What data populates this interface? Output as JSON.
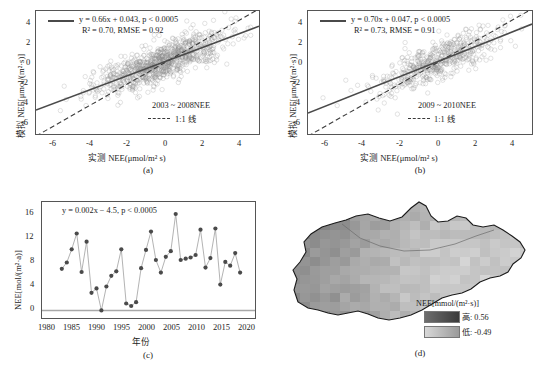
{
  "figure": {
    "panel_letters": {
      "a": "(a)",
      "b": "(b)",
      "c": "(c)",
      "d": "(d)"
    },
    "caption": ""
  },
  "panel_a": {
    "letter": "(a)",
    "equation_line1": "y = 0.66x + 0.043, p < 0.0005",
    "equation_line2": "R² = 0.70, RMSE = 0.92",
    "xlabel": "实测 NEE(μmol/m² s)",
    "ylabel": "模拟 NEE[μmol/(m²·s)]",
    "legend_series": "2003 ~ 2008NEE",
    "legend_oneone": "1:1 线",
    "xticks": [
      "-6",
      "-4",
      "-2",
      "0",
      "2",
      "4"
    ],
    "yticks": [
      "4",
      "2",
      "0",
      "-2",
      "-4",
      "-6"
    ],
    "xlim": [
      -7.2,
      5.0
    ],
    "ylim": [
      -7.0,
      4.8
    ],
    "slope": 0.66,
    "intercept": 0.043,
    "r2": 0.7,
    "rmse": 0.92,
    "p_value": "< 0.0005",
    "n_points": 900
  },
  "panel_b": {
    "letter": "(b)",
    "equation_line1": "y = 0.70x + 0.047, p < 0.0005",
    "equation_line2": "R² = 0.73, RMSE = 0.91",
    "xlabel": "实测 NEE(μmol/m² s)",
    "ylabel": "模拟 NEE[μmol/(m²·s)]",
    "legend_series": "2009 ~ 2010NEE",
    "legend_oneone": "1:1 线",
    "xticks": [
      "-6",
      "-4",
      "-2",
      "0",
      "2",
      "4"
    ],
    "yticks": [
      "4",
      "2",
      "0",
      "-2",
      "-4",
      "-6"
    ],
    "xlim": [
      -7.2,
      5.0
    ],
    "ylim": [
      -7.0,
      4.8
    ],
    "slope": 0.7,
    "intercept": 0.047,
    "r2": 0.73,
    "rmse": 0.91,
    "p_value": "< 0.0005",
    "n_points": 520
  },
  "panel_c": {
    "letter": "(c)",
    "equation": "y = 0.002x − 4.5, p < 0.0005",
    "xlabel": "年份",
    "ylabel": "NEE[mol/(m²·a)]",
    "xticks": [
      "1980",
      "1985",
      "1990",
      "1995",
      "2000",
      "2005",
      "2010",
      "2015",
      "2020"
    ],
    "yticks": [
      "0",
      "4",
      "8",
      "12",
      "16"
    ],
    "xlim": [
      1978,
      2021
    ],
    "ylim": [
      -1.2,
      17.2
    ]
  },
  "panel_d": {
    "letter": "(d)",
    "legend_title": "NEE[mmol/(m²·s)]",
    "legend_high": "高: 0.56",
    "legend_low": "低: -0.49",
    "high_value": 0.56,
    "low_value": -0.49
  },
  "chart_data": [
    {
      "id": "panel_a",
      "type": "scatter",
      "title": "(a) 2003 ~ 2008 NEE 模拟值 vs 实测值",
      "xlabel": "实测 NEE(μmol/m² s)",
      "ylabel": "模拟 NEE[μmol/(m²·s)]",
      "xlim": [
        -7.2,
        5.0
      ],
      "ylim": [
        -7.0,
        4.8
      ],
      "xticks": [
        -6,
        -4,
        -2,
        0,
        2,
        4
      ],
      "yticks": [
        -6,
        -4,
        -2,
        0,
        2,
        4
      ],
      "grid": false,
      "legend_position": "lower-right",
      "legend": [
        "2003 ~ 2008NEE",
        "1:1 线"
      ],
      "annotations": [
        "y = 0.66x + 0.043, p < 0.0005",
        "R² = 0.70, RMSE = 0.92"
      ],
      "series": [
        {
          "name": "回归线",
          "kind": "line",
          "style": "solid",
          "slope": 0.66,
          "intercept": 0.043
        },
        {
          "name": "1:1 线",
          "kind": "line",
          "style": "dashed",
          "slope": 1.0,
          "intercept": 0.0
        }
      ],
      "point_cloud": {
        "n": 900,
        "x_mean": -0.35,
        "x_sd": 1.75,
        "x_min": -7.0,
        "x_max": 4.6,
        "residual_sd": 0.92,
        "marker": "open-circle",
        "color": "#8a8a8a",
        "alpha": 0.45,
        "size": 2.2
      }
    },
    {
      "id": "panel_b",
      "type": "scatter",
      "title": "(b) 2009 ~ 2010 NEE 模拟值 vs 实测值",
      "xlabel": "实测 NEE(μmol/m² s)",
      "ylabel": "模拟 NEE[μmol/(m²·s)]",
      "xlim": [
        -7.2,
        5.0
      ],
      "ylim": [
        -7.0,
        4.8
      ],
      "xticks": [
        -6,
        -4,
        -2,
        0,
        2,
        4
      ],
      "yticks": [
        -6,
        -4,
        -2,
        0,
        2,
        4
      ],
      "grid": false,
      "legend_position": "lower-right",
      "legend": [
        "2009 ~ 2010NEE",
        "1:1 线"
      ],
      "annotations": [
        "y = 0.70x + 0.047, p < 0.0005",
        "R² = 0.73, RMSE = 0.91"
      ],
      "series": [
        {
          "name": "回归线",
          "kind": "line",
          "style": "solid",
          "slope": 0.7,
          "intercept": 0.047
        },
        {
          "name": "1:1 线",
          "kind": "line",
          "style": "dashed",
          "slope": 1.0,
          "intercept": 0.0
        }
      ],
      "point_cloud": {
        "n": 520,
        "x_mean": -0.1,
        "x_sd": 1.55,
        "x_min": -6.8,
        "x_max": 4.8,
        "residual_sd": 0.91,
        "marker": "open-circle",
        "color": "#8a8a8a",
        "alpha": 0.45,
        "size": 2.2
      }
    },
    {
      "id": "panel_c",
      "type": "line",
      "title": "(c) 年 NEE 时间序列",
      "xlabel": "年份",
      "ylabel": "NEE[mol/(m²·a)]",
      "xlim": [
        1978,
        2021
      ],
      "ylim": [
        -1.2,
        17.2
      ],
      "xticks": [
        1980,
        1985,
        1990,
        1995,
        2000,
        2005,
        2010,
        2015,
        2020
      ],
      "yticks": [
        0,
        4,
        8,
        12,
        16
      ],
      "grid": false,
      "annotations": [
        "y = 0.002x − 4.5, p < 0.0005"
      ],
      "marker": "filled-circle",
      "marker_color": "#4a4a4a",
      "line_color": "#9a9a9a",
      "zero_line": true,
      "x": [
        1982,
        1983,
        1984,
        1985,
        1986,
        1987,
        1988,
        1989,
        1990,
        1991,
        1992,
        1993,
        1994,
        1995,
        1996,
        1997,
        1998,
        1999,
        2000,
        2001,
        2002,
        2003,
        2004,
        2005,
        2006,
        2007,
        2008,
        2009,
        2010,
        2011,
        2012,
        2013,
        2014,
        2015,
        2016,
        2017,
        2018
      ],
      "values": [
        6.6,
        7.6,
        9.7,
        12.2,
        6.1,
        10.9,
        2.8,
        3.5,
        0.0,
        3.8,
        5.5,
        6.2,
        9.7,
        1.1,
        0.7,
        1.3,
        6.7,
        9.6,
        12.5,
        8.0,
        6.0,
        8.5,
        9.4,
        15.3,
        8.0,
        8.2,
        8.4,
        8.8,
        12.8,
        6.8,
        8.3,
        13.0,
        4.1,
        7.7,
        7.1,
        9.1,
        6.0
      ],
      "trend_slope": 0.002,
      "trend_intercept": -4.5
    },
    {
      "id": "panel_d",
      "type": "heatmap",
      "title": "(d) NEE 空间分布",
      "legend_title": "NEE[mmol/(m²·s)]",
      "legend_high_label": "高: 0.56",
      "legend_low_label": "低: -0.49",
      "vmin": -0.49,
      "vmax": 0.56,
      "colormap": "grayscale (dark = high, light = low)",
      "region_outline": true
    }
  ]
}
